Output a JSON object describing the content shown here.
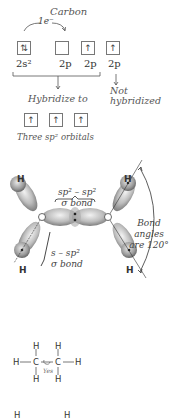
{
  "electron_config": {
    "title": "Carbon",
    "promotion_label": "1e⁻",
    "orbitals": [
      {
        "label": "2s²",
        "content": "⇅"
      },
      {
        "label": "2p",
        "content": ""
      },
      {
        "label": "2p",
        "content": "↑"
      },
      {
        "label": "2p",
        "content": "↑"
      }
    ],
    "hybridize_label": "Hybridize to",
    "not_hybridized_label": "Not\nhybridized",
    "not_hybridized_line1": "Not",
    "not_hybridized_line2": "hybridized"
  },
  "hybrid_orbitals": {
    "boxes": [
      "↑",
      "↑",
      "↑"
    ],
    "caption": "Three sp² orbitals"
  },
  "ethylene_diagram": {
    "atoms": {
      "hydrogen": "H"
    },
    "cc_bond_label_line1": "sp² – sp²",
    "cc_bond_label_line2": "σ bond",
    "ch_bond_label_line1": "s – sp²",
    "ch_bond_label_line2": "σ bond",
    "angle_label_line1": "Bond angles",
    "angle_label_line2": "are 120°"
  },
  "ethane_structure": {
    "atoms": [
      "H",
      "H",
      "H",
      "C",
      "C",
      "H",
      "H",
      "H"
    ],
    "rotation_label": "Yes",
    "H": "H",
    "C": "C"
  },
  "bottom_structure": {
    "H": "H"
  }
}
